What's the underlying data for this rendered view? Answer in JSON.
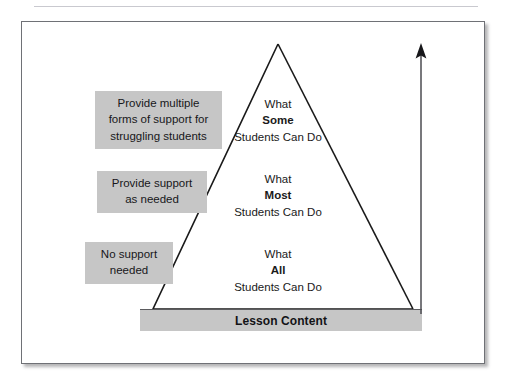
{
  "page_header": {
    "text": "",
    "rule_visible": true
  },
  "figure": {
    "title": "",
    "base_bar": {
      "label": "Lesson Content"
    },
    "arrow": {
      "icon": "arrow-up-icon",
      "direction": "up",
      "meaning": ""
    },
    "tiers": [
      {
        "id": "some",
        "line1": "What",
        "emphasis": "Some",
        "line3": "Students Can Do"
      },
      {
        "id": "most",
        "line1": "What",
        "emphasis": "Most",
        "line3": "Students Can Do"
      },
      {
        "id": "all",
        "line1": "What",
        "emphasis": "All",
        "line3": "Students Can Do"
      }
    ],
    "support_boxes": [
      {
        "id": "multiple-forms",
        "line1": "Provide multiple",
        "line2": "forms of support for",
        "line3": "struggling students"
      },
      {
        "id": "as-needed",
        "line1": "Provide support",
        "line2": "as needed",
        "line3": ""
      },
      {
        "id": "none",
        "line1": "No support",
        "line2": "needed",
        "line3": ""
      }
    ]
  },
  "colors": {
    "box_fill": "#c6c6c6",
    "frame_border": "#6f7176",
    "stroke": "#1a1a1a",
    "text": "#1a1a1a",
    "header_rule": "#c9c9cf"
  }
}
